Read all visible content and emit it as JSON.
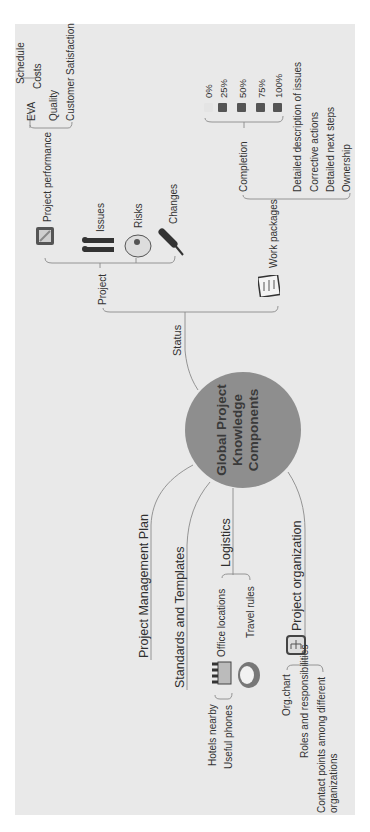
{
  "central": {
    "lines": [
      "Global Project",
      "Knowledge",
      "Components"
    ],
    "fill": "#8e8e8e"
  },
  "branches": {
    "status": {
      "label": "Status",
      "project": {
        "label": "Project",
        "project_performance": {
          "label": "Project performance",
          "icon": "clipboard-edit-icon",
          "children": [
            {
              "label": "EVA",
              "children": [
                "Schedule",
                "Costs"
              ]
            },
            {
              "label": "Quality"
            },
            {
              "label": "Customer Satisfaction"
            }
          ]
        },
        "issues": {
          "label": "Issues",
          "icon": "people-icon"
        },
        "risks": {
          "label": "Risks",
          "icon": "hard-hat-icon"
        },
        "changes": {
          "label": "Changes",
          "icon": "screwdriver-icon"
        }
      },
      "work_packages": {
        "label": "Work packages",
        "icon": "checklist-icon",
        "completion": {
          "label": "Completion",
          "levels": [
            "0%",
            "25%",
            "50%",
            "75%",
            "100%"
          ]
        },
        "children": [
          "Detailed description of issues",
          "Corrective actions",
          "Detailed next steps",
          "Ownership"
        ]
      }
    },
    "project_management_plan": {
      "label": "Project Management Plan"
    },
    "standards_and_templates": {
      "label": "Standards and Templates"
    },
    "logistics": {
      "label": "Logistics",
      "office_locations": {
        "label": "Office locations",
        "icon": "building-icon",
        "children": [
          "Hotels nearby",
          "Useful phones"
        ]
      },
      "travel_rules": {
        "label": "Travel rules",
        "icon": "hat-icon"
      }
    },
    "project_organization": {
      "label": "Project organization",
      "icon": "org-chart-icon",
      "children": [
        "Org.chart",
        "Roles and responsibilities",
        "Contact points among different",
        "organizations"
      ]
    }
  }
}
